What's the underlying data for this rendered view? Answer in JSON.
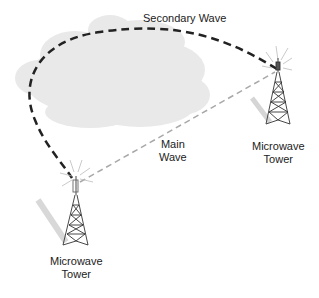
{
  "diagram": {
    "secondary_wave": {
      "label": "Secondary Wave",
      "color": "#222222",
      "style": "dashed"
    },
    "main_wave": {
      "line1": "Main",
      "line2": "Wave",
      "color": "#999999",
      "style": "dashed"
    },
    "tower_right": {
      "line1": "Microwave",
      "line2": "Tower"
    },
    "tower_left": {
      "line1": "Microwave",
      "line2": "Tower"
    },
    "cloud": {
      "color": "#e8e8e8"
    }
  }
}
